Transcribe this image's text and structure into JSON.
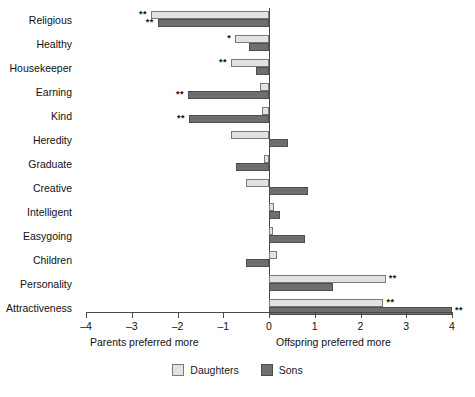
{
  "chart_data": {
    "type": "bar",
    "orientation": "horizontal",
    "title": "",
    "xlabel": "",
    "ylabel": "",
    "xlim": [
      -4,
      4
    ],
    "xticks": [
      -4,
      -3,
      -2,
      -1,
      0,
      1,
      2,
      3,
      4
    ],
    "xticklabels": [
      "–4",
      "–3",
      "–2",
      "–1",
      "0",
      "1",
      "2",
      "3",
      "4"
    ],
    "grid": false,
    "zero_reference_line": true,
    "legend_position": "bottom-center",
    "axis_captions": {
      "left": "Parents preferred more",
      "right": "Offspring preferred more"
    },
    "categories": [
      "Religious",
      "Healthy",
      "Housekeeper",
      "Earning",
      "Kind",
      "Heredity",
      "Graduate",
      "Creative",
      "Intelligent",
      "Easygoing",
      "Children",
      "Personality",
      "Attractiveness"
    ],
    "series": [
      {
        "name": "Daughters",
        "color": "#e2e2de",
        "values": [
          -2.58,
          -0.74,
          -0.83,
          -0.2,
          -0.15,
          -0.83,
          -0.1,
          -0.5,
          0.1,
          0.08,
          0.18,
          2.55,
          2.5
        ],
        "significance": [
          "**",
          "*",
          "**",
          "",
          "",
          "",
          "",
          "",
          "",
          "",
          "",
          "**",
          "**"
        ]
      },
      {
        "name": "Sons",
        "color": "#6e6e6e",
        "values": [
          -2.43,
          -0.44,
          -0.28,
          -1.77,
          -1.75,
          0.42,
          -0.72,
          0.85,
          0.25,
          0.78,
          -0.5,
          1.4,
          4.0
        ],
        "significance": [
          "**",
          "",
          "",
          "**",
          "**",
          "",
          "",
          "",
          "",
          "",
          "",
          "",
          "**"
        ]
      }
    ],
    "legend": [
      {
        "label": "Daughters",
        "color": "#e2e2de"
      },
      {
        "label": "Sons",
        "color": "#6e6e6e"
      }
    ]
  }
}
